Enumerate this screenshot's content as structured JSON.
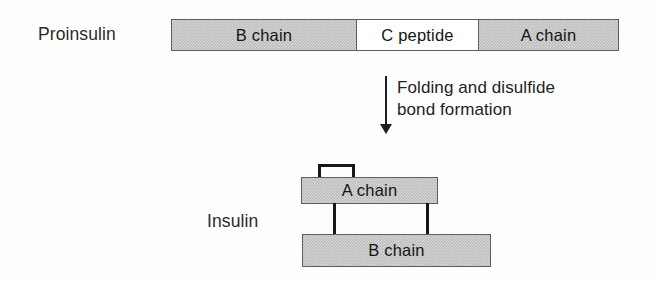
{
  "figure": {
    "rows": {
      "proinsulin": {
        "label": "Proinsulin",
        "segments": [
          {
            "name": "b-chain",
            "label": "B chain",
            "fill": "#bdbdbd"
          },
          {
            "name": "c-peptide",
            "label": "C peptide",
            "fill": "#ffffff"
          },
          {
            "name": "a-chain",
            "label": "A chain",
            "fill": "#bdbdbd"
          }
        ]
      },
      "insulin": {
        "label": "Insulin",
        "segments": [
          {
            "name": "a-chain",
            "label": "A chain",
            "fill": "#bdbdbd"
          },
          {
            "name": "b-chain",
            "label": "B chain",
            "fill": "#bdbdbd"
          }
        ]
      }
    },
    "transition": {
      "arrow_text": "Folding and disulfide\nbond formation",
      "arrow_direction": "down",
      "arrow_color": "#1c1c1c"
    },
    "bonds": {
      "interchain_count": 2,
      "intrachain_count": 1,
      "color": "#171717"
    },
    "colors": {
      "chain_fill": "#bdbdbd",
      "peptide_fill": "#ffffff",
      "outline": "#5d5d5d",
      "text": "#222222",
      "background": "#fefefe"
    }
  }
}
